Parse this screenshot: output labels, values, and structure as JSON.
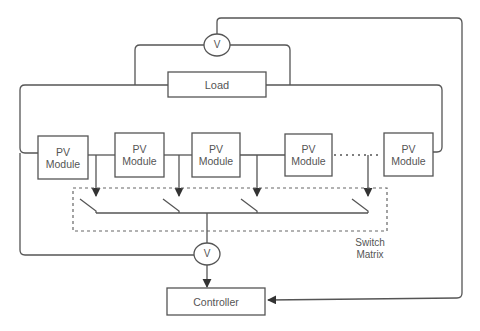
{
  "diagram": {
    "load": {
      "label": "Load"
    },
    "voltmeters": [
      {
        "id": "top",
        "label": "V"
      },
      {
        "id": "bottom",
        "label": "V"
      }
    ],
    "pv_modules": [
      {
        "label": "PV\nModule",
        "line1": "PV",
        "line2": "Module"
      },
      {
        "label": "PV\nModule",
        "line1": "PV",
        "line2": "Module"
      },
      {
        "label": "PV\nModule",
        "line1": "PV",
        "line2": "Module"
      },
      {
        "label": "PV\nModule",
        "line1": "PV",
        "line2": "Module"
      },
      {
        "label": "PV\nModule",
        "line1": "PV",
        "line2": "Module"
      }
    ],
    "switch_matrix": {
      "line1": "Switch",
      "line2": "Matrix"
    },
    "controller": {
      "label": "Controller"
    },
    "colors": {
      "stroke": "#555555",
      "text": "#555555",
      "background": "#ffffff"
    }
  }
}
